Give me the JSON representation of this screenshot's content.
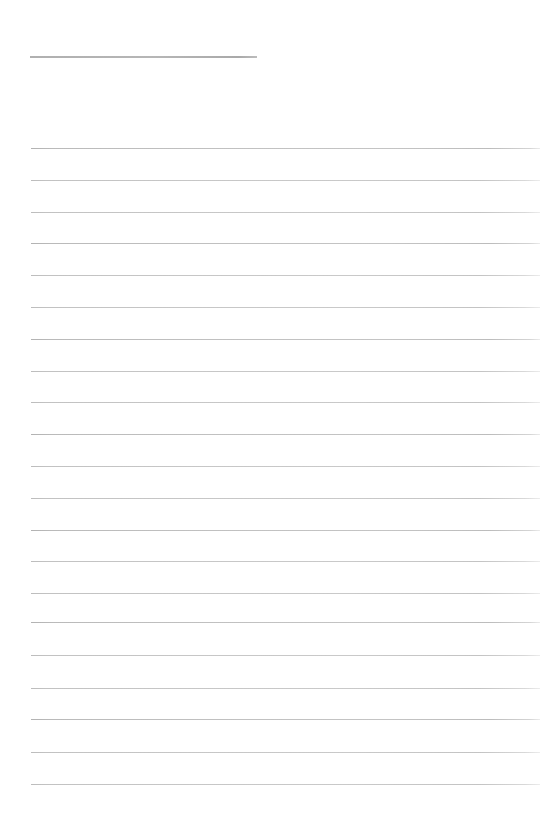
{
  "document": {
    "kind": "blank-lined-form",
    "page_width": 545,
    "page_height": 823,
    "background_color": "#ffffff",
    "state": "empty"
  },
  "header": {
    "title_text": "",
    "title_placeholder": "",
    "rule": {
      "x": 30,
      "y": 56,
      "width": 227,
      "thickness": 2,
      "color": "#b4b4b4"
    }
  },
  "body": {
    "first_line_y": 148,
    "line_spacing": 31.8,
    "line_left": 31,
    "line_right": 540,
    "line_width": 509,
    "line_thickness": 1,
    "line_color": "#c4c4c4",
    "line_color_fade_right": "#ececec",
    "line_count": 21,
    "lines": [
      {
        "index": 1,
        "y": 148,
        "text": ""
      },
      {
        "index": 2,
        "y": 180,
        "text": ""
      },
      {
        "index": 3,
        "y": 212,
        "text": ""
      },
      {
        "index": 4,
        "y": 243,
        "text": ""
      },
      {
        "index": 5,
        "y": 275,
        "text": ""
      },
      {
        "index": 6,
        "y": 307,
        "text": ""
      },
      {
        "index": 7,
        "y": 339,
        "text": ""
      },
      {
        "index": 8,
        "y": 371,
        "text": ""
      },
      {
        "index": 9,
        "y": 402,
        "text": ""
      },
      {
        "index": 10,
        "y": 434,
        "text": ""
      },
      {
        "index": 11,
        "y": 466,
        "text": ""
      },
      {
        "index": 12,
        "y": 498,
        "text": ""
      },
      {
        "index": 13,
        "y": 530,
        "text": ""
      },
      {
        "index": 14,
        "y": 561,
        "text": ""
      },
      {
        "index": 15,
        "y": 593,
        "text": ""
      },
      {
        "index": 16,
        "y": 622,
        "text": ""
      },
      {
        "index": 17,
        "y": 655,
        "text": ""
      },
      {
        "index": 18,
        "y": 688,
        "text": ""
      },
      {
        "index": 19,
        "y": 719,
        "text": ""
      },
      {
        "index": 20,
        "y": 752,
        "text": ""
      },
      {
        "index": 21,
        "y": 784,
        "text": ""
      }
    ]
  }
}
